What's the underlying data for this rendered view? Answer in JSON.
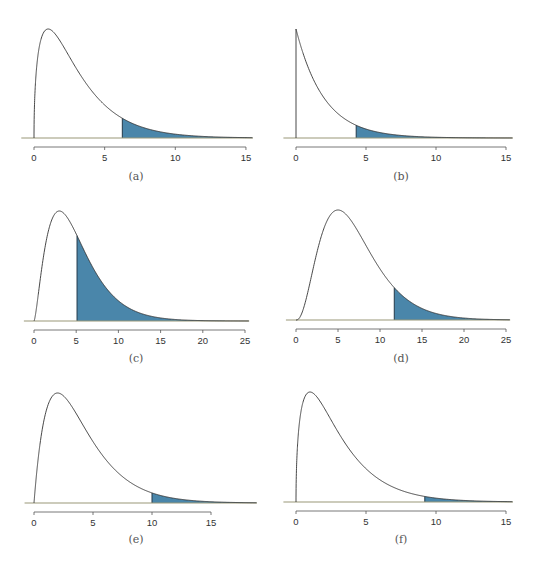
{
  "figure": {
    "fill_color": "#4a86aa",
    "curve_color": "#333333",
    "baseline_color": "#9a9878",
    "axis_color": "#555555"
  },
  "chart_data": [
    {
      "type": "area",
      "panel": "a",
      "label": "(a)",
      "description": "Right-skewed density curve (chi-square, df≈3) with upper tail shaded",
      "distribution": {
        "family": "chi-square",
        "df": 3
      },
      "xticks": [
        0,
        5,
        10,
        15
      ],
      "xlim": [
        -0.9,
        15.5
      ],
      "shade_from": 6.25,
      "layout": {
        "x0_px": 34,
        "unit_px": 14.13,
        "base_y": 138,
        "peak_y": 29,
        "label_x": 136,
        "label_y": 180
      }
    },
    {
      "type": "area",
      "panel": "b",
      "label": "(b)",
      "description": "Exponential-shaped density (chi-square, df=2) with upper tail shaded",
      "distribution": {
        "family": "chi-square",
        "df": 2
      },
      "xticks": [
        0,
        5,
        10,
        15
      ],
      "xlim": [
        -0.9,
        15.5
      ],
      "shade_from": 4.3,
      "layout": {
        "x0_px": 296,
        "unit_px": 14.0,
        "base_y": 138,
        "peak_y": 29,
        "label_x": 401,
        "label_y": 180
      }
    },
    {
      "type": "area",
      "panel": "c",
      "label": "(c)",
      "description": "Right-skewed density (chi-square, df≈5) with large upper tail shaded",
      "distribution": {
        "family": "chi-square",
        "df": 5
      },
      "xticks": [
        0,
        5,
        10,
        15,
        20,
        25
      ],
      "xlim": [
        -1.2,
        25.5
      ],
      "shade_from": 5.1,
      "layout": {
        "x0_px": 34,
        "unit_px": 8.44,
        "base_y": 321,
        "peak_y": 211,
        "label_x": 136,
        "label_y": 362
      }
    },
    {
      "type": "area",
      "panel": "d",
      "label": "(d)",
      "description": "Right-skewed density (chi-square, df≈7) with upper tail shaded",
      "distribution": {
        "family": "chi-square",
        "df": 7
      },
      "xticks": [
        0,
        5,
        10,
        15,
        20,
        25
      ],
      "xlim": [
        -1.2,
        25.5
      ],
      "shade_from": 11.7,
      "layout": {
        "x0_px": 296,
        "unit_px": 8.4,
        "base_y": 320,
        "peak_y": 210,
        "label_x": 401,
        "label_y": 362
      }
    },
    {
      "type": "area",
      "panel": "e",
      "label": "(e)",
      "description": "Right-skewed density (chi-square, df≈4) with upper tail shaded",
      "distribution": {
        "family": "chi-square",
        "df": 4
      },
      "xticks": [
        0,
        5,
        10,
        15
      ],
      "xlim": [
        -0.8,
        18.9
      ],
      "shade_from": 10,
      "layout": {
        "x0_px": 34,
        "unit_px": 11.8,
        "base_y": 503,
        "peak_y": 393,
        "label_x": 136,
        "label_y": 543
      }
    },
    {
      "type": "area",
      "panel": "f",
      "label": "(f)",
      "description": "Right-skewed density (chi-square, df≈3) with small upper tail shaded",
      "distribution": {
        "family": "chi-square",
        "df": 3
      },
      "xticks": [
        0,
        5,
        10,
        15
      ],
      "xlim": [
        -0.9,
        15.5
      ],
      "shade_from": 9.2,
      "layout": {
        "x0_px": 296,
        "unit_px": 14.0,
        "base_y": 502,
        "peak_y": 392,
        "label_x": 401,
        "label_y": 543
      }
    }
  ]
}
